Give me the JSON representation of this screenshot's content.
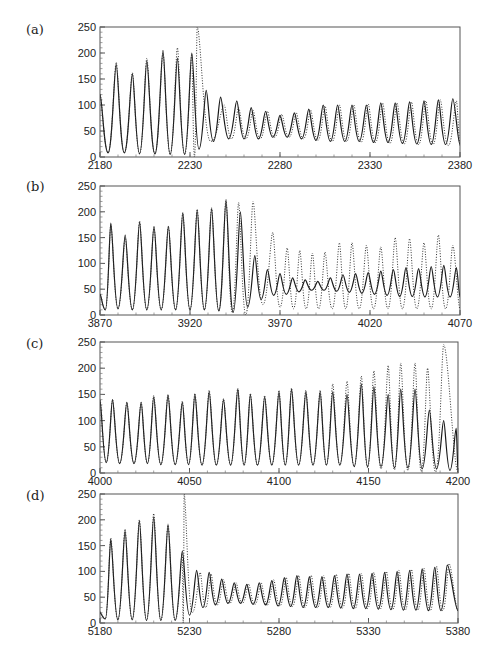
{
  "figure": {
    "panels": [
      {
        "label": "(a)"
      },
      {
        "label": "(b)"
      },
      {
        "label": "(c)"
      },
      {
        "label": "(d)"
      }
    ]
  },
  "chart_data": [
    {
      "type": "line",
      "title": "(a)",
      "xlabel": "",
      "ylabel": "",
      "xlim": [
        2180,
        2380
      ],
      "ylim": [
        0,
        250
      ],
      "xticks": [
        2180,
        2230,
        2280,
        2330,
        2380
      ],
      "yticks": [
        0,
        50,
        100,
        150,
        200,
        250
      ],
      "grid": false,
      "series": [
        {
          "name": "solid",
          "style": "solid",
          "peaks_x": [
            2180,
            2189,
            2198,
            2206,
            2215,
            2223,
            2231,
            2239,
            2247,
            2256,
            2264,
            2272,
            2280,
            2288,
            2296,
            2304,
            2312,
            2320,
            2328,
            2336,
            2344,
            2352,
            2360,
            2368,
            2376
          ],
          "peaks_y": [
            120,
            178,
            160,
            185,
            205,
            190,
            200,
            128,
            115,
            108,
            95,
            88,
            80,
            85,
            92,
            100,
            100,
            100,
            100,
            104,
            104,
            106,
            108,
            110,
            112
          ],
          "troughs_y": [
            30,
            8,
            8,
            6,
            6,
            5,
            5,
            15,
            30,
            35,
            35,
            35,
            38,
            38,
            35,
            32,
            30,
            30,
            30,
            28,
            28,
            26,
            25,
            24,
            24
          ]
        },
        {
          "name": "dotted",
          "style": "dotted",
          "peaks_x": [
            2180,
            2189,
            2198,
            2206,
            2215,
            2223,
            2231,
            2234,
            2249,
            2257,
            2265,
            2273,
            2281,
            2289,
            2297,
            2305,
            2313,
            2321,
            2329,
            2337,
            2345,
            2353,
            2361,
            2369,
            2378
          ],
          "peaks_y": [
            120,
            182,
            162,
            190,
            200,
            210,
            198,
            250,
            100,
            95,
            90,
            88,
            82,
            85,
            90,
            98,
            100,
            100,
            102,
            104,
            104,
            106,
            108,
            110,
            108
          ],
          "troughs_y": [
            30,
            8,
            8,
            6,
            6,
            5,
            5,
            0,
            30,
            35,
            35,
            35,
            38,
            38,
            35,
            32,
            30,
            30,
            28,
            28,
            26,
            25,
            24,
            24,
            22
          ]
        }
      ]
    },
    {
      "type": "line",
      "title": "(b)",
      "xlabel": "",
      "ylabel": "",
      "xlim": [
        3870,
        4070
      ],
      "ylim": [
        0,
        250
      ],
      "xticks": [
        3870,
        3920,
        3970,
        4020,
        4070
      ],
      "yticks": [
        0,
        50,
        100,
        150,
        200,
        250
      ],
      "grid": false,
      "series": [
        {
          "name": "solid",
          "style": "solid",
          "peaks_x": [
            3870,
            3876,
            3884,
            3892,
            3900,
            3908,
            3916,
            3924,
            3932,
            3940,
            3948,
            3956,
            3963,
            3970,
            3977,
            3984,
            3991,
            3998,
            4005,
            4012,
            4019,
            4026,
            4033,
            4040,
            4047,
            4054,
            4061,
            4068
          ],
          "peaks_y": [
            40,
            178,
            155,
            180,
            172,
            172,
            198,
            203,
            206,
            222,
            200,
            115,
            88,
            80,
            72,
            68,
            65,
            72,
            78,
            80,
            82,
            85,
            88,
            92,
            90,
            94,
            96,
            92
          ],
          "troughs_y": [
            25,
            10,
            12,
            10,
            10,
            10,
            10,
            10,
            10,
            8,
            5,
            15,
            30,
            38,
            40,
            45,
            48,
            48,
            46,
            44,
            42,
            40,
            38,
            36,
            36,
            35,
            35,
            35
          ]
        },
        {
          "name": "dotted",
          "style": "dotted",
          "peaks_x": [
            3870,
            3876,
            3884,
            3892,
            3900,
            3908,
            3916,
            3924,
            3932,
            3940,
            3947,
            3955,
            3966,
            3974,
            3981,
            3988,
            3995,
            4003,
            4010,
            4018,
            4026,
            4034,
            4042,
            4050,
            4058,
            4066
          ],
          "peaks_y": [
            40,
            175,
            150,
            182,
            170,
            172,
            198,
            205,
            208,
            224,
            218,
            220,
            160,
            130,
            125,
            120,
            122,
            140,
            140,
            135,
            132,
            150,
            148,
            140,
            155,
            135
          ],
          "troughs_y": [
            25,
            10,
            12,
            10,
            10,
            10,
            10,
            10,
            10,
            8,
            5,
            0,
            20,
            15,
            12,
            12,
            12,
            12,
            12,
            12,
            12,
            12,
            12,
            12,
            12,
            12
          ]
        }
      ]
    },
    {
      "type": "line",
      "title": "(c)",
      "xlabel": "",
      "ylabel": "",
      "xlim": [
        4000,
        4200
      ],
      "ylim": [
        0,
        250
      ],
      "xticks": [
        4000,
        4050,
        4100,
        4150,
        4200
      ],
      "yticks": [
        0,
        50,
        100,
        150,
        200,
        250
      ],
      "grid": false,
      "series": [
        {
          "name": "solid",
          "style": "solid",
          "peaks_x": [
            4000,
            4007,
            4015,
            4023,
            4030,
            4038,
            4046,
            4053,
            4061,
            4069,
            4077,
            4084,
            4092,
            4100,
            4107,
            4115,
            4123,
            4130,
            4138,
            4146,
            4153,
            4161,
            4168,
            4176,
            4184,
            4192,
            4199
          ],
          "peaks_y": [
            138,
            140,
            135,
            135,
            145,
            148,
            135,
            150,
            155,
            140,
            160,
            150,
            145,
            155,
            160,
            155,
            155,
            155,
            150,
            170,
            165,
            150,
            160,
            160,
            120,
            100,
            85
          ],
          "troughs_y": [
            40,
            20,
            18,
            18,
            18,
            16,
            16,
            16,
            15,
            15,
            15,
            15,
            15,
            15,
            15,
            15,
            15,
            15,
            15,
            12,
            12,
            12,
            10,
            10,
            8,
            8,
            5
          ]
        },
        {
          "name": "dotted",
          "style": "dotted",
          "peaks_x": [
            4000,
            4007,
            4015,
            4023,
            4030,
            4038,
            4046,
            4053,
            4061,
            4069,
            4077,
            4084,
            4092,
            4100,
            4107,
            4115,
            4123,
            4130,
            4138,
            4146,
            4153,
            4161,
            4168,
            4176,
            4183,
            4192
          ],
          "peaks_y": [
            140,
            140,
            135,
            135,
            148,
            150,
            137,
            152,
            158,
            142,
            162,
            152,
            148,
            158,
            162,
            158,
            158,
            170,
            175,
            185,
            195,
            205,
            210,
            210,
            200,
            245
          ],
          "troughs_y": [
            40,
            20,
            18,
            18,
            18,
            16,
            16,
            16,
            15,
            15,
            15,
            15,
            15,
            15,
            15,
            15,
            15,
            15,
            15,
            12,
            10,
            8,
            6,
            5,
            3,
            2
          ]
        }
      ]
    },
    {
      "type": "line",
      "title": "(d)",
      "xlabel": "",
      "ylabel": "",
      "xlim": [
        5180,
        5380
      ],
      "ylim": [
        0,
        250
      ],
      "xticks": [
        5180,
        5230,
        5280,
        5330,
        5380
      ],
      "yticks": [
        0,
        50,
        100,
        150,
        200,
        250
      ],
      "grid": false,
      "series": [
        {
          "name": "solid",
          "style": "solid",
          "peaks_x": [
            5180,
            5186,
            5194,
            5202,
            5210,
            5218,
            5226,
            5234,
            5241,
            5248,
            5255,
            5262,
            5269,
            5276,
            5283,
            5290,
            5297,
            5304,
            5311,
            5318,
            5325,
            5332,
            5339,
            5346,
            5353,
            5360,
            5367,
            5374
          ],
          "peaks_y": [
            20,
            162,
            178,
            198,
            205,
            190,
            140,
            102,
            98,
            85,
            78,
            75,
            78,
            82,
            88,
            92,
            90,
            90,
            92,
            95,
            95,
            96,
            98,
            100,
            102,
            105,
            108,
            112
          ],
          "troughs_y": [
            15,
            8,
            6,
            6,
            5,
            5,
            5,
            15,
            30,
            35,
            38,
            38,
            36,
            35,
            33,
            32,
            30,
            30,
            30,
            29,
            28,
            28,
            27,
            26,
            25,
            25,
            24,
            24
          ]
        },
        {
          "name": "dotted",
          "style": "dotted",
          "peaks_x": [
            5180,
            5186,
            5194,
            5202,
            5210,
            5218,
            5226,
            5227,
            5236,
            5242,
            5249,
            5256,
            5263,
            5270,
            5277,
            5284,
            5291,
            5298,
            5305,
            5312,
            5319,
            5326,
            5333,
            5340,
            5347,
            5354,
            5361,
            5368,
            5375
          ],
          "peaks_y": [
            22,
            165,
            182,
            200,
            212,
            192,
            135,
            250,
            98,
            95,
            84,
            78,
            76,
            78,
            84,
            88,
            92,
            92,
            92,
            94,
            96,
            96,
            98,
            100,
            102,
            104,
            106,
            110,
            115
          ],
          "troughs_y": [
            15,
            8,
            6,
            6,
            5,
            5,
            5,
            0,
            20,
            30,
            35,
            38,
            38,
            36,
            35,
            33,
            32,
            30,
            30,
            30,
            29,
            28,
            28,
            27,
            26,
            25,
            25,
            24,
            24
          ]
        }
      ]
    }
  ]
}
